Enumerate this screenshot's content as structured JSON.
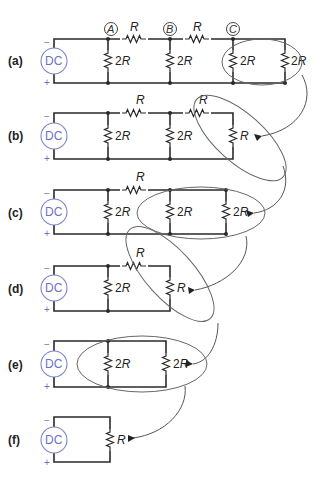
{
  "figure": {
    "source_label": "DC",
    "minus_sign": "−",
    "plus_sign": "+",
    "nodes": {
      "a": "A",
      "b": "B",
      "c": "C"
    },
    "panels": [
      {
        "label": "(a)",
        "series_resistor": "R",
        "shunts": [
          "2R",
          "2R",
          "2R",
          "2R"
        ]
      },
      {
        "label": "(b)",
        "series_resistor": "R",
        "shunts": [
          "2R",
          "2R",
          "R"
        ]
      },
      {
        "label": "(c)",
        "series_resistor": "R",
        "shunts": [
          "2R",
          "2R",
          "2R"
        ]
      },
      {
        "label": "(d)",
        "series_resistor": "R",
        "shunts": [
          "2R",
          "R"
        ]
      },
      {
        "label": "(e)",
        "shunts": [
          "2R",
          "2R"
        ]
      },
      {
        "label": "(f)",
        "shunts": [
          "R"
        ]
      }
    ],
    "value_2R_num": "2",
    "value_R": "R"
  }
}
